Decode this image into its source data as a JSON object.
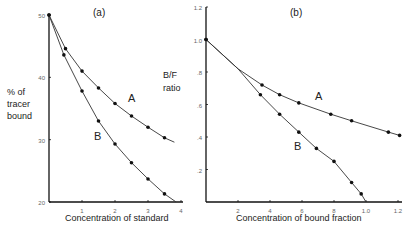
{
  "chart_data": [
    {
      "type": "line",
      "panel": "(a)",
      "title": "(a)",
      "xlabel": "Concentration of standard",
      "ylabel": "% of tracer bound",
      "xlim": [
        0,
        4
      ],
      "ylim": [
        20,
        50
      ],
      "xticks": [
        "1",
        "2",
        "3",
        "4"
      ],
      "yticks": [
        "20",
        "30",
        "40",
        "50"
      ],
      "series": [
        {
          "name": "A",
          "x": [
            0,
            0.5,
            1.0,
            1.5,
            2.0,
            2.5,
            3.0,
            3.5,
            3.8
          ],
          "y": [
            50,
            44.6,
            41.0,
            38.3,
            35.8,
            33.8,
            32.0,
            30.3,
            29.6
          ],
          "markers": [
            true,
            true,
            true,
            true,
            true,
            true,
            true,
            true,
            false
          ]
        },
        {
          "name": "B",
          "x": [
            0,
            0.45,
            1.0,
            1.5,
            2.0,
            2.5,
            3.0,
            3.5,
            3.85
          ],
          "y": [
            50,
            43.6,
            37.8,
            33.0,
            29.3,
            26.3,
            23.7,
            21.3,
            20.0
          ],
          "markers": [
            true,
            true,
            true,
            true,
            true,
            true,
            true,
            true,
            false
          ]
        }
      ]
    },
    {
      "type": "line",
      "panel": "(b)",
      "title": "(b)",
      "xlabel": "Concentration of bound fraction",
      "ylabel": "B/F ratio",
      "xlim": [
        0,
        1.2
      ],
      "ylim": [
        0,
        1.2
      ],
      "xticks": [
        "2",
        "4",
        "6",
        "8",
        "1.0",
        "1.2"
      ],
      "yticks": [
        ".2",
        ".4",
        ".6",
        ".8",
        "1.0",
        "1.2"
      ],
      "series": [
        {
          "name": "A",
          "x": [
            0,
            0.2,
            0.35,
            0.46,
            0.58,
            0.78,
            0.91,
            1.14,
            1.21
          ],
          "y": [
            1.0,
            0.82,
            0.72,
            0.66,
            0.61,
            0.54,
            0.5,
            0.43,
            0.41
          ],
          "markers": [
            true,
            false,
            true,
            true,
            true,
            true,
            true,
            true,
            true
          ]
        },
        {
          "name": "B",
          "x": [
            0,
            0.2,
            0.34,
            0.46,
            0.58,
            0.69,
            0.8,
            0.91,
            0.97,
            1.0
          ],
          "y": [
            1.0,
            0.82,
            0.66,
            0.54,
            0.43,
            0.33,
            0.25,
            0.12,
            0.05,
            0.0
          ],
          "markers": [
            true,
            false,
            true,
            true,
            true,
            true,
            true,
            true,
            true,
            false
          ]
        }
      ]
    }
  ],
  "labels": {
    "a_title": "(a)",
    "b_title": "(b)",
    "a_ylabel_1": "% of",
    "a_ylabel_2": "tracer",
    "a_ylabel_3": "bound",
    "b_ylabel_1": "B/F",
    "b_ylabel_2": "ratio",
    "a_xlabel": "Concentration of standard",
    "b_xlabel": "Concentration of bound fraction",
    "a_curve_A": "A",
    "a_curve_B": "B",
    "b_curve_A": "A",
    "b_curve_B": "B"
  }
}
